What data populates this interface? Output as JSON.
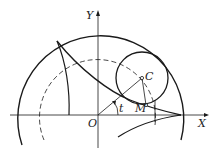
{
  "diagram": {
    "type": "geometry",
    "labels": {
      "y_axis": "Y",
      "x_axis": "X",
      "origin": "O",
      "center": "C",
      "point": "M",
      "angle": "t"
    },
    "colors": {
      "stroke": "#1a1a1a",
      "background": "#ffffff"
    }
  }
}
